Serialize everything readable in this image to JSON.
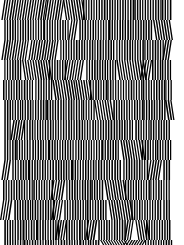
{
  "image": {
    "description": "Black and white vertical stripe op-art pattern with horizontal bands of phase-shifted stripes",
    "width": 184,
    "height": 245,
    "pattern_region": {
      "x": 3,
      "y": 0,
      "width": 168,
      "height": 245
    },
    "stripe_period": 2.6,
    "band_height": 20,
    "colors": {
      "stripe": "#000000",
      "background": "#ffffff"
    }
  }
}
